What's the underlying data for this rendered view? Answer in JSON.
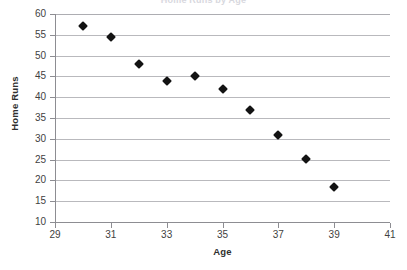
{
  "chart_data": {
    "type": "scatter",
    "title": "",
    "xlabel": "Age",
    "ylabel": "Home Runs",
    "xlim": [
      29,
      41
    ],
    "ylim": [
      10,
      60
    ],
    "grid": "horizontal",
    "legend": "none",
    "x_ticks": [
      29,
      31,
      33,
      35,
      37,
      39,
      41
    ],
    "y_ticks": [
      10,
      15,
      20,
      25,
      30,
      35,
      40,
      45,
      50,
      55,
      60
    ],
    "x_tick_labels": [
      "29",
      "31",
      "33",
      "35",
      "37",
      "39",
      "41"
    ],
    "y_tick_labels": [
      "10",
      "15",
      "20",
      "25",
      "30",
      "35",
      "40",
      "45",
      "50",
      "55",
      "60"
    ],
    "marker": "diamond",
    "marker_color": "#131313",
    "gridline_color": "#b9b9bd",
    "axis_color": "#8d8d92",
    "background": "#ffffff",
    "x": [
      30,
      31,
      32,
      33,
      34,
      35,
      36,
      37,
      38,
      39
    ],
    "y": [
      57,
      54.5,
      48,
      44,
      45,
      42,
      37,
      31,
      25.2,
      18.5
    ],
    "points": [
      {
        "x": 30,
        "y": 57
      },
      {
        "x": 31,
        "y": 54.5
      },
      {
        "x": 32,
        "y": 48
      },
      {
        "x": 33,
        "y": 44
      },
      {
        "x": 34,
        "y": 45
      },
      {
        "x": 35,
        "y": 42
      },
      {
        "x": 36,
        "y": 37
      },
      {
        "x": 37,
        "y": 31
      },
      {
        "x": 38,
        "y": 25.2
      },
      {
        "x": 39,
        "y": 18.5
      }
    ]
  },
  "title_remnant": "Home Runs by Age"
}
